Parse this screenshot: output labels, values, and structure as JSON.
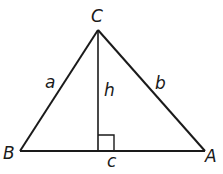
{
  "diagram": {
    "colors": {
      "stroke": "#1a1a1a",
      "background": "#ffffff"
    },
    "vertices": [
      {
        "name": "C",
        "x": 98,
        "y": 30,
        "label_x": 97,
        "label_y": 22
      },
      {
        "name": "B",
        "x": 20,
        "y": 151,
        "label_x": 10,
        "label_y": 159
      },
      {
        "name": "A",
        "x": 205,
        "y": 151,
        "label_x": 212,
        "label_y": 162
      }
    ],
    "sides": [
      {
        "name": "a",
        "from": "B",
        "to": "C",
        "label_x": 51,
        "label_y": 88
      },
      {
        "name": "b",
        "from": "C",
        "to": "A",
        "label_x": 161,
        "label_y": 89
      },
      {
        "name": "c",
        "from": "B",
        "to": "A",
        "label_x": 112,
        "label_y": 166
      }
    ],
    "altitude": {
      "name": "h",
      "from": "C",
      "foot_x": 98,
      "foot_y": 151,
      "label_x": 109,
      "label_y": 96
    },
    "right_angle_marker": {
      "x": 98,
      "y": 135,
      "size": 16
    },
    "labels": {
      "vertex_C": "C",
      "vertex_B": "B",
      "vertex_A": "A",
      "side_a": "a",
      "side_b": "b",
      "side_c": "c",
      "altitude_h": "h"
    }
  }
}
